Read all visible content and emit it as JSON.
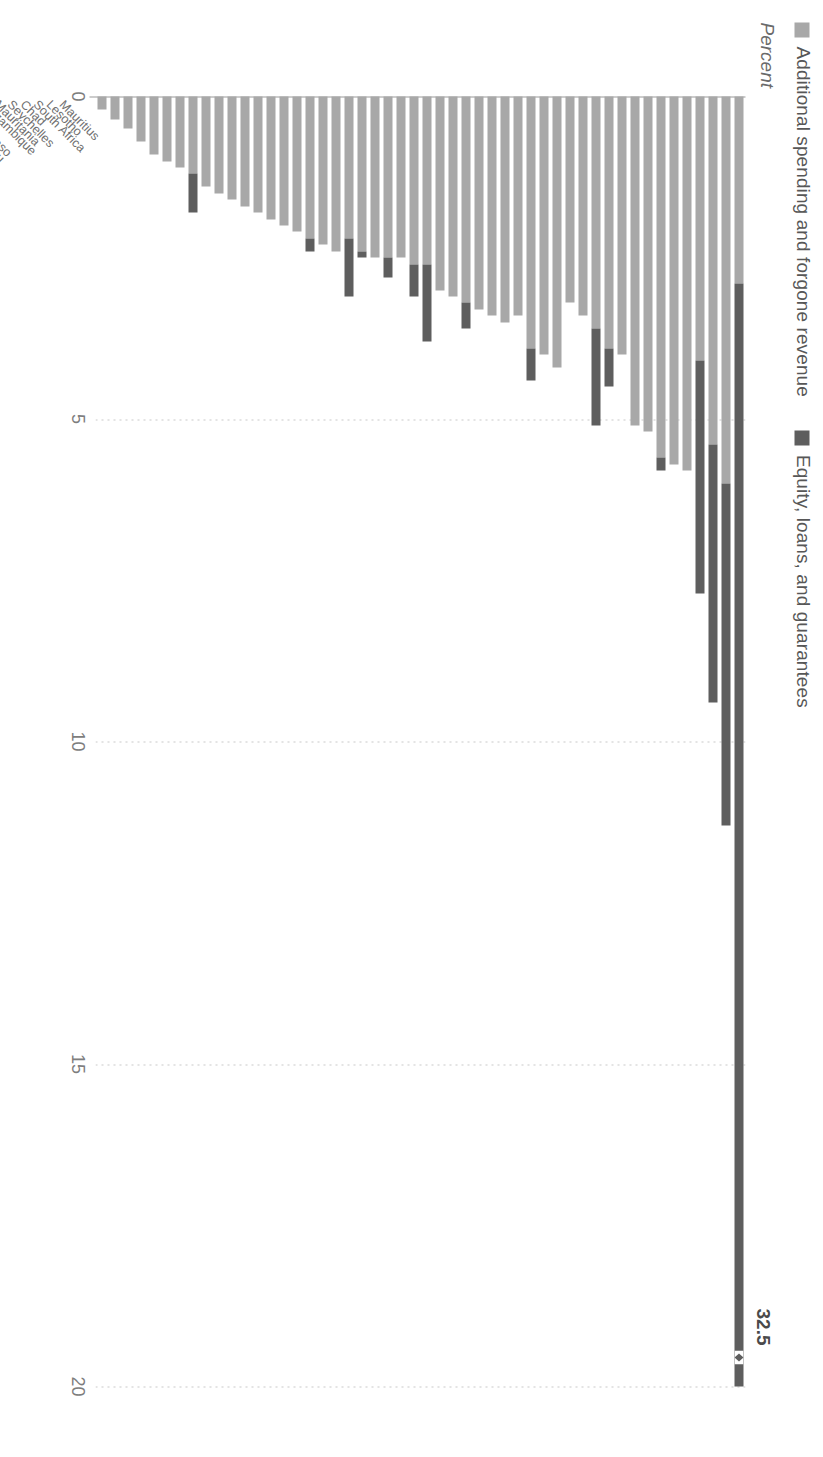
{
  "chart_data": {
    "type": "bar",
    "orientation": "vertical-rotated",
    "stacked": true,
    "title": "",
    "xlabel": "",
    "ylabel": "Percent",
    "ylim": [
      0,
      20
    ],
    "yticks": [
      "0",
      "5",
      "10",
      "15",
      "20"
    ],
    "grid": true,
    "legend_position": "top-left",
    "categories": [
      "Mauritius",
      "Lesotho",
      "South Africa",
      "Chad",
      "Seychelles",
      "Mauritania",
      "Mozambique",
      "Mali",
      "Burkina Faso",
      "Guinea-Bissau",
      "Senegal",
      "Sierra Leone",
      "Rwanda",
      "Morocco",
      "Cabo Verde",
      "Togo",
      "Ghana",
      "São Tomé and Príncipe",
      "Comoros",
      "Eswatini",
      "Congo",
      "Burundi",
      "Djibouti",
      "Namibia",
      "Zambia",
      "Kenya",
      "Tunisia",
      "Ethiopia",
      "Gabon",
      "Niger",
      "Côte d'Ivoire",
      "Equatorial Guinea",
      "Benin",
      "Libya",
      "Madagascar",
      "Nigeria",
      "Guinea",
      "Central African Rep.",
      "Botswana",
      "Congo, Dem. Rep.",
      "Sudan",
      "Cameroon",
      "Uganda",
      "The Gambia",
      "Angola",
      "Nigeria ",
      "Malawi",
      "South Sudan",
      "Liberia",
      "Ghana "
    ],
    "series": [
      {
        "name": "Additional spending and forgone revenue",
        "color": "#a8a8a8",
        "values": [
          2.9,
          6.0,
          5.4,
          4.1,
          5.8,
          5.7,
          5.6,
          5.2,
          5.1,
          4.0,
          3.9,
          3.6,
          3.4,
          3.2,
          4.2,
          4.0,
          3.9,
          3.4,
          3.5,
          3.4,
          3.3,
          3.2,
          3.1,
          3.0,
          2.6,
          2.6,
          2.5,
          2.5,
          2.5,
          2.4,
          2.2,
          2.4,
          2.3,
          2.2,
          2.1,
          2.0,
          1.9,
          1.8,
          1.7,
          1.6,
          1.5,
          1.4,
          1.2,
          1.1,
          1.0,
          0.9,
          0.7,
          0.5,
          0.35,
          0.2
        ]
      },
      {
        "name": "Equity, loans, and guarantees",
        "color": "#5e5e5e",
        "values": [
          29.6,
          5.3,
          4.0,
          3.6,
          0.0,
          0.0,
          0.2,
          0.0,
          0.0,
          0.0,
          0.6,
          1.5,
          0.0,
          0.0,
          0.0,
          0.0,
          0.5,
          0.0,
          0.0,
          0.0,
          0.0,
          0.4,
          0.0,
          0.0,
          1.2,
          0.5,
          0.0,
          0.3,
          0.0,
          0.1,
          0.9,
          0.0,
          0.0,
          0.2,
          0.0,
          0.0,
          0.0,
          0.0,
          0.0,
          0.0,
          0.0,
          0.0,
          0.6,
          0.0,
          0.0,
          0.0,
          0.0,
          0.0,
          0.0,
          0.0
        ]
      }
    ],
    "annotations": [
      {
        "text": "32.5",
        "category": "Mauritius",
        "note": "total for broken bar"
      }
    ],
    "axis_break": {
      "category": "Mauritius",
      "symbol": "break-marker"
    }
  },
  "legend": {
    "items": [
      {
        "label": "Additional spending and forgone revenue",
        "color": "#a8a8a8"
      },
      {
        "label": "Equity, loans, and guarantees",
        "color": "#5e5e5e"
      }
    ]
  },
  "axis": {
    "title": "Percent",
    "ticks": [
      "0",
      "5",
      "10",
      "15",
      "20"
    ]
  }
}
